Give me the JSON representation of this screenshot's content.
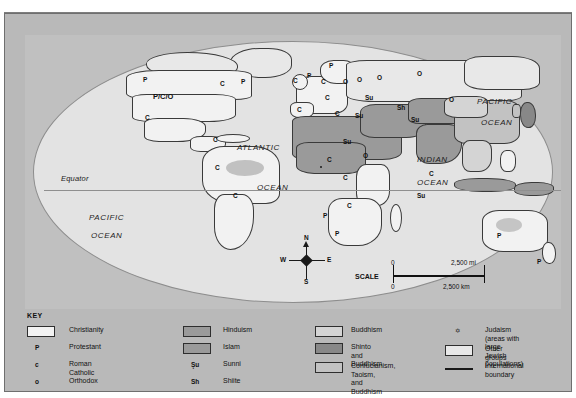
{
  "map": {
    "equator_label": "Equator",
    "oceans": [
      {
        "name": "ATLANTIC",
        "x": 212,
        "y": 108
      },
      {
        "name": "OCEAN",
        "x": 232,
        "y": 148
      },
      {
        "name": "PACIFIC",
        "x": 64,
        "y": 178
      },
      {
        "name": "OCEAN",
        "x": 66,
        "y": 196
      },
      {
        "name": "PACIFIC",
        "x": 452,
        "y": 62
      },
      {
        "name": "OCEAN",
        "x": 456,
        "y": 83
      },
      {
        "name": "INDIAN",
        "x": 392,
        "y": 120
      },
      {
        "name": "OCEAN",
        "x": 392,
        "y": 143
      }
    ],
    "markers": [
      {
        "label": "P",
        "x": 118,
        "y": 42
      },
      {
        "label": "P/C/O",
        "x": 128,
        "y": 58
      },
      {
        "label": "C",
        "x": 120,
        "y": 80
      },
      {
        "label": "C",
        "x": 195,
        "y": 46
      },
      {
        "label": "P",
        "x": 216,
        "y": 44
      },
      {
        "label": "C",
        "x": 188,
        "y": 102
      },
      {
        "label": "C",
        "x": 190,
        "y": 130
      },
      {
        "label": "C",
        "x": 208,
        "y": 158
      },
      {
        "label": "C",
        "x": 268,
        "y": 43
      },
      {
        "label": "P",
        "x": 282,
        "y": 38
      },
      {
        "label": "P",
        "x": 304,
        "y": 28
      },
      {
        "label": "C",
        "x": 296,
        "y": 44
      },
      {
        "label": "C",
        "x": 300,
        "y": 60
      },
      {
        "label": "O",
        "x": 318,
        "y": 44
      },
      {
        "label": "O",
        "x": 332,
        "y": 42
      },
      {
        "label": "O",
        "x": 352,
        "y": 40
      },
      {
        "label": "O",
        "x": 392,
        "y": 36
      },
      {
        "label": "O",
        "x": 424,
        "y": 62
      },
      {
        "label": "C",
        "x": 272,
        "y": 72
      },
      {
        "label": "C",
        "x": 310,
        "y": 76
      },
      {
        "label": "Su",
        "x": 330,
        "y": 78
      },
      {
        "label": "Su",
        "x": 340,
        "y": 60
      },
      {
        "label": "Sh",
        "x": 372,
        "y": 70
      },
      {
        "label": "Su",
        "x": 386,
        "y": 82
      },
      {
        "label": "Su",
        "x": 318,
        "y": 104
      },
      {
        "label": "C",
        "x": 302,
        "y": 122
      },
      {
        "label": "O",
        "x": 338,
        "y": 118
      },
      {
        "label": "C",
        "x": 318,
        "y": 140
      },
      {
        "label": "C",
        "x": 322,
        "y": 168
      },
      {
        "label": "P",
        "x": 310,
        "y": 196
      },
      {
        "label": "P",
        "x": 298,
        "y": 178
      },
      {
        "label": "C",
        "x": 404,
        "y": 136
      },
      {
        "label": "Su",
        "x": 392,
        "y": 158
      },
      {
        "label": "P",
        "x": 472,
        "y": 198
      },
      {
        "label": "P",
        "x": 512,
        "y": 224
      }
    ],
    "compass": {
      "n": "N",
      "s": "S",
      "e": "E",
      "w": "W"
    },
    "scale": {
      "label": "SCALE",
      "mi_zero": "0",
      "mi_max": "2,500 mi",
      "km_zero": "0",
      "km_max": "2,500 km"
    }
  },
  "key": {
    "title": "KEY",
    "col1": [
      {
        "type": "swatch",
        "fill": "f-christian",
        "label": "Christianity"
      },
      {
        "type": "letter",
        "mark": "P",
        "label": "Protestant"
      },
      {
        "type": "letter",
        "mark": "c",
        "label": "Roman Catholic"
      },
      {
        "type": "letter",
        "mark": "o",
        "label": "Orthodox"
      }
    ],
    "col2": [
      {
        "type": "swatch",
        "fill": "f-hindu",
        "label": "Hinduism"
      },
      {
        "type": "swatch",
        "fill": "f-islam",
        "label": "Islam"
      },
      {
        "type": "letter",
        "mark": "Şu",
        "label": "Sunni"
      },
      {
        "type": "letter",
        "mark": "Sh",
        "label": "Shiite"
      }
    ],
    "col3": [
      {
        "type": "swatch",
        "fill": "f-buddh",
        "label": "Buddhism"
      },
      {
        "type": "swatch",
        "fill": "f-shinto",
        "label": "Shinto and\nBuddhism"
      },
      {
        "type": "swatch",
        "fill": "f-conf",
        "label": "Confucianism, Taoism,\nand Buddhism"
      }
    ],
    "col4": [
      {
        "type": "star",
        "mark": "✡",
        "label": "Judaism (areas with large\nJewish populations)"
      },
      {
        "type": "swatch",
        "fill": "f-other",
        "label": "Other groups"
      },
      {
        "type": "line",
        "label": "International boundary"
      }
    ]
  },
  "colors": {
    "plate": "#b9b9b9",
    "ocean": "#e3e3e3",
    "christianity": "#f2f2f2",
    "islam": "#9a9a9a",
    "hinduism": "#9a9a9a",
    "buddhism": "#d4d4d4",
    "shinto": "#888888",
    "confucian": "#c2c2c2",
    "other": "#e8e8e8",
    "boundary": "#3a3a3a"
  }
}
